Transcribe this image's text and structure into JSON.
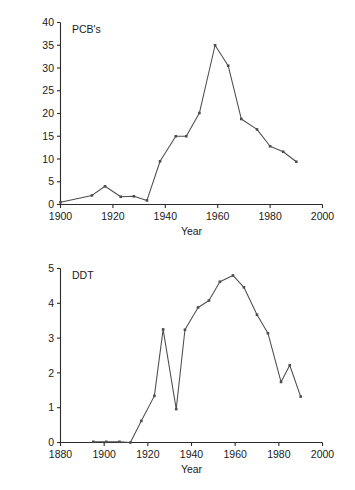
{
  "figure": {
    "ylabel": "Concentration in µg/kg (parts per billion)",
    "width": 355,
    "height": 490,
    "line_color": "#4d4d4d",
    "axis_color": "#2b2b2b",
    "text_color": "#1a1a1a"
  },
  "chart_data": [
    {
      "type": "line",
      "title": "PCB's",
      "xlabel": "Year",
      "ylabel": "Concentration in µg/kg (parts per billion)",
      "xlim": [
        1900,
        2000
      ],
      "ylim": [
        0,
        40
      ],
      "xticks": [
        1900,
        1920,
        1940,
        1960,
        1980,
        2000
      ],
      "xtick_labels": [
        "1900",
        "1920",
        "1940",
        "1960",
        "1980",
        "2000"
      ],
      "yticks": [
        0,
        5,
        10,
        15,
        20,
        25,
        30,
        35,
        40
      ],
      "ytick_labels": [
        "0",
        "5",
        "10",
        "15",
        "20",
        "25",
        "30",
        "35",
        "40"
      ],
      "grid": false,
      "legend": "none",
      "markers": true,
      "x": [
        1900,
        1912,
        1917,
        1923,
        1928,
        1933,
        1938,
        1944,
        1948,
        1953,
        1959,
        1964,
        1969,
        1975,
        1980,
        1985,
        1990
      ],
      "values": [
        0.5,
        2.0,
        4.0,
        1.7,
        1.8,
        0.9,
        9.5,
        15.0,
        15.0,
        20.1,
        35.0,
        30.5,
        18.8,
        16.5,
        12.8,
        11.6,
        9.4
      ]
    },
    {
      "type": "line",
      "title": "DDT",
      "xlabel": "Year",
      "ylabel": "Concentration in µg/kg (parts per billion)",
      "xlim": [
        1880,
        2000
      ],
      "ylim": [
        0,
        5
      ],
      "xticks": [
        1880,
        1900,
        1920,
        1940,
        1960,
        1980,
        2000
      ],
      "xtick_labels": [
        "1880",
        "1900",
        "1920",
        "1940",
        "1960",
        "1980",
        "2000"
      ],
      "yticks": [
        0,
        1,
        2,
        3,
        4,
        5
      ],
      "ytick_labels": [
        "0",
        "1",
        "2",
        "3",
        "4",
        "5"
      ],
      "grid": false,
      "legend": "none",
      "markers": true,
      "x": [
        1895,
        1901,
        1907,
        1912,
        1917,
        1923,
        1927,
        1933,
        1937,
        1943,
        1948,
        1953,
        1959,
        1964,
        1970,
        1975,
        1981,
        1985,
        1990
      ],
      "values": [
        0.02,
        0.02,
        0.02,
        0.0,
        0.62,
        1.34,
        3.25,
        0.96,
        3.24,
        3.88,
        4.08,
        4.62,
        4.8,
        4.46,
        3.67,
        3.14,
        1.74,
        2.22,
        1.32
      ]
    }
  ]
}
